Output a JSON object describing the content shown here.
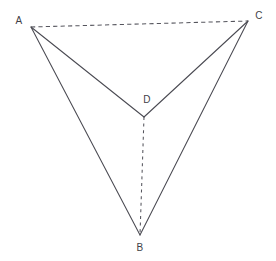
{
  "figure": {
    "kind": "geometry-diagram",
    "background_color": "#ffffff",
    "stroke_color": "#4a4a52",
    "dash_color": "#55555d",
    "label_color": "#3f3f47",
    "canvas": {
      "width": 276,
      "height": 261
    },
    "vertices": [
      {
        "id": "A",
        "label": "A",
        "x": 31,
        "y": 27,
        "label_x": 19,
        "label_y": 21
      },
      {
        "id": "B",
        "label": "B",
        "x": 140,
        "y": 235,
        "label_x": 140,
        "label_y": 248
      },
      {
        "id": "C",
        "label": "C",
        "x": 248,
        "y": 21,
        "label_x": 259,
        "label_y": 16
      },
      {
        "id": "D",
        "label": "D",
        "x": 144,
        "y": 117,
        "label_x": 147,
        "label_y": 100
      }
    ],
    "edges": [
      {
        "id": "AD",
        "from": "A",
        "to": "D",
        "style": "solid",
        "path": "M 31 27 L 144 117"
      },
      {
        "id": "AB",
        "from": "A",
        "to": "B",
        "style": "solid",
        "path": "M 31 27 L 140 235"
      },
      {
        "id": "CD",
        "from": "C",
        "to": "D",
        "style": "solid",
        "path": "M 248 21 L 144 117"
      },
      {
        "id": "CB",
        "from": "C",
        "to": "B",
        "style": "solid",
        "path": "M 248 21 L 140 235"
      },
      {
        "id": "AC",
        "from": "A",
        "to": "C",
        "style": "dashed-long",
        "path": "M 31 27 L 248 21"
      },
      {
        "id": "DB",
        "from": "D",
        "to": "B",
        "style": "dashed-short",
        "path": "M 144 117 L 140 235"
      }
    ]
  }
}
